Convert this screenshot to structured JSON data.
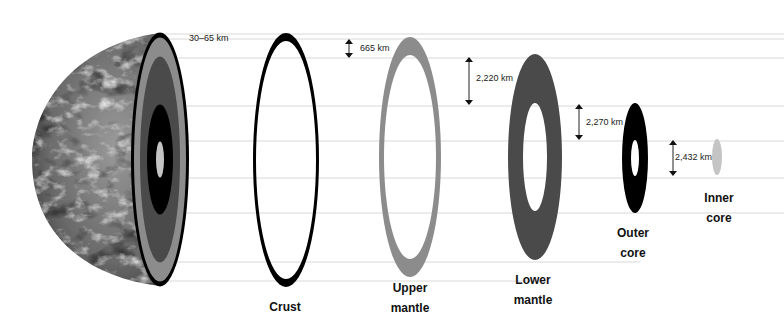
{
  "diagram": {
    "layers": [
      {
        "id": "crust",
        "label_lines": [
          "Crust"
        ],
        "thickness": "30–65 km",
        "color": "#000000"
      },
      {
        "id": "upper-mantle",
        "label_lines": [
          "Upper",
          "mantle"
        ],
        "thickness": "665 km",
        "color": "#8c8c8c"
      },
      {
        "id": "lower-mantle",
        "label_lines": [
          "Lower",
          "mantle"
        ],
        "thickness": "2,220 km",
        "color": "#4a4a4a"
      },
      {
        "id": "outer-core",
        "label_lines": [
          "Outer",
          "core"
        ],
        "thickness": "2,270 km",
        "color": "#000000"
      },
      {
        "id": "inner-core",
        "label_lines": [
          "Inner",
          "core"
        ],
        "thickness": "2,432 km",
        "color": "#c4c4c4"
      }
    ],
    "guide_line_color": "#d8d8d8",
    "earth_cutaway": {
      "image": "earth-globe-cutaway",
      "band_colors": [
        "#000000",
        "#8c8c8c",
        "#4a4a4a",
        "#000000",
        "#c4c4c4"
      ]
    }
  }
}
